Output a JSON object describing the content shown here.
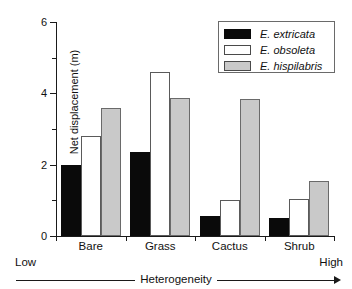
{
  "chart_data": {
    "type": "bar",
    "title": "",
    "xlabel": "Heterogeneity",
    "ylabel": "Net displacement (m)",
    "categories": [
      "Bare",
      "Grass",
      "Cactus",
      "Shrub"
    ],
    "series": [
      {
        "name": "E. extricata",
        "key": "black",
        "color": "#0a0a0a",
        "values": [
          2.0,
          2.35,
          0.55,
          0.5
        ]
      },
      {
        "name": "E. obsoleta",
        "key": "white",
        "color": "#ffffff",
        "values": [
          2.8,
          4.6,
          1.0,
          1.05
        ]
      },
      {
        "name": "E. hispilabris",
        "key": "gray",
        "color": "#c9c9c9",
        "values": [
          3.6,
          3.87,
          3.85,
          1.55
        ]
      }
    ],
    "ylim": [
      0,
      6
    ],
    "ytick_major": [
      0,
      2,
      4,
      6
    ],
    "ytick_minor": [
      1,
      3,
      5
    ],
    "ytick_labels": [
      "0",
      "2",
      "4",
      "6"
    ],
    "grid": false,
    "legend_position": "top-right",
    "x_axis_annotation": {
      "left": "Low",
      "right": "High",
      "label": "Heterogeneity"
    }
  },
  "axes": {
    "y_title": "Net displacement (m)",
    "y_labels": [
      "6",
      "4",
      "2",
      "0"
    ]
  },
  "legend": {
    "entries": [
      {
        "label": "E. extricata",
        "swatch": "black-swatch"
      },
      {
        "label": "E. obsoleta",
        "swatch": "white-swatch"
      },
      {
        "label": "E. hispilabris",
        "swatch": "gray-swatch"
      }
    ]
  },
  "heterogeneity_axis": {
    "low": "Low",
    "high": "High",
    "title": "Heterogeneity",
    "arrow": "right-arrow-icon"
  },
  "categories": [
    "Bare",
    "Grass",
    "Cactus",
    "Shrub"
  ]
}
